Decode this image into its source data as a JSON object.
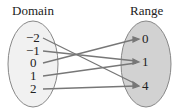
{
  "domain_title": "Domain",
  "range_title": "Range",
  "domain": [
    "−2",
    "−1",
    "0",
    "1",
    "2"
  ],
  "range": [
    "0",
    "1",
    "4"
  ],
  "mappings": [
    {
      "from": "−2",
      "to": "4"
    },
    {
      "from": "−1",
      "to": "1"
    },
    {
      "from": "0",
      "to": "0"
    },
    {
      "from": "1",
      "to": "1"
    },
    {
      "from": "2",
      "to": "4"
    }
  ],
  "colors": {
    "domain_fill": "#f1f1f1",
    "range_fill": "#d2d2d2",
    "stroke": "#777777"
  }
}
